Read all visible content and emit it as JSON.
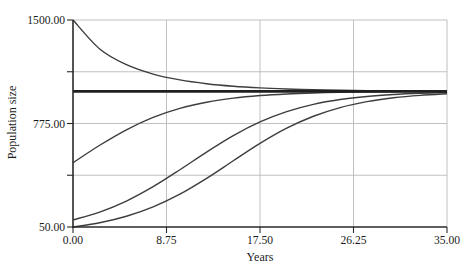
{
  "style": {
    "background": "#ffffff",
    "text_color": "#1c1c1c",
    "curve_color": "#3d3d3d",
    "equilibrium_color": "#1f1f1f",
    "grid_color": "#b9b9b9",
    "axis_color": "#2a2a2a"
  },
  "chart_data": {
    "type": "line",
    "title": "",
    "xlabel": "Years",
    "ylabel": "Population size",
    "xlim": [
      0,
      35
    ],
    "ylim": [
      50,
      1500
    ],
    "grid": true,
    "legend": "none",
    "carrying_capacity": 1000,
    "x_ticks": [
      {
        "value": 0,
        "label": "0.00"
      },
      {
        "value": 8.75,
        "label": "8.75"
      },
      {
        "value": 17.5,
        "label": "17.50"
      },
      {
        "value": 26.25,
        "label": "26.25"
      },
      {
        "value": 35,
        "label": "35.00"
      }
    ],
    "y_ticks": [
      {
        "value": 50,
        "label": "50.00"
      },
      {
        "value": 412.5,
        "label": ""
      },
      {
        "value": 775,
        "label": "775.00"
      },
      {
        "value": 1137.5,
        "label": ""
      },
      {
        "value": 1500,
        "label": "1500.00"
      }
    ],
    "series": [
      {
        "id": "start-1500",
        "name": "N0 = 1500",
        "role": "trajectory",
        "points": [
          [
            0,
            1500
          ],
          [
            2.5,
            1297.2
          ],
          [
            5,
            1186.9
          ],
          [
            7.5,
            1121.4
          ],
          [
            10,
            1080.4
          ],
          [
            12.5,
            1053.9
          ],
          [
            15,
            1036.4
          ],
          [
            17.5,
            1024.7
          ],
          [
            20,
            1016.9
          ],
          [
            22.5,
            1011.5
          ],
          [
            25,
            1007.9
          ],
          [
            27.5,
            1005.4
          ],
          [
            30,
            1003.7
          ],
          [
            32.5,
            1002.6
          ],
          [
            35,
            1001.8
          ]
        ]
      },
      {
        "id": "equilibrium-1000",
        "name": "N0 = 1000 (carrying capacity)",
        "role": "equilibrium",
        "points": [
          [
            0,
            1000
          ],
          [
            35,
            1000
          ]
        ]
      },
      {
        "id": "start-500",
        "name": "N0 = 500",
        "role": "trajectory",
        "points": [
          [
            0,
            500
          ],
          [
            2.5,
            622.5
          ],
          [
            5,
            731.1
          ],
          [
            7.5,
            817.6
          ],
          [
            10,
            880.8
          ],
          [
            12.5,
            924.1
          ],
          [
            15,
            952.6
          ],
          [
            17.5,
            970.7
          ],
          [
            20,
            982.0
          ],
          [
            22.5,
            989.0
          ],
          [
            25,
            993.3
          ],
          [
            27.5,
            995.9
          ],
          [
            30,
            997.5
          ],
          [
            32.5,
            998.5
          ],
          [
            35,
            999.1
          ]
        ]
      },
      {
        "id": "start-100",
        "name": "N0 = 100",
        "role": "trajectory",
        "points": [
          [
            0,
            100
          ],
          [
            2.5,
            154.8
          ],
          [
            5,
            232.0
          ],
          [
            7.5,
            332.4
          ],
          [
            10,
            450.8
          ],
          [
            12.5,
            575.1
          ],
          [
            15,
            690.6
          ],
          [
            17.5,
            786.3
          ],
          [
            20,
            858.5
          ],
          [
            22.5,
            909.1
          ],
          [
            25,
            942.8
          ],
          [
            27.5,
            964.5
          ],
          [
            30,
            978.2
          ],
          [
            32.5,
            986.6
          ],
          [
            35,
            991.9
          ]
        ]
      },
      {
        "id": "start-50",
        "name": "N0 = 50",
        "role": "trajectory",
        "points": [
          [
            0,
            50
          ],
          [
            2.5,
            79.8
          ],
          [
            5,
            125.2
          ],
          [
            7.5,
            190.9
          ],
          [
            10,
            280.0
          ],
          [
            12.5,
            390.7
          ],
          [
            15,
            513.9
          ],
          [
            17.5,
            635.4
          ],
          [
            20,
            741.8
          ],
          [
            22.5,
            825.7
          ],
          [
            25,
            886.5
          ],
          [
            27.5,
            927.9
          ],
          [
            30,
            955.0
          ],
          [
            32.5,
            972.2
          ],
          [
            35,
            983.0
          ]
        ]
      }
    ]
  }
}
